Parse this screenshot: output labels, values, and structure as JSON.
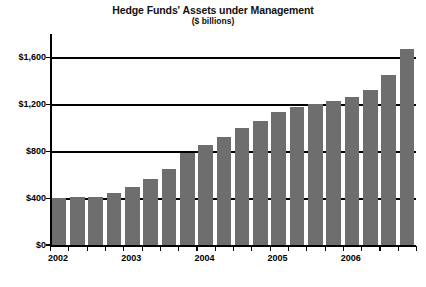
{
  "chart_data": {
    "type": "bar",
    "title": "Hedge Funds' Assets under Management",
    "subtitle": "($ billions)",
    "xlabel": "",
    "ylabel": "",
    "unit": "$ billions",
    "grid": true,
    "legend": null,
    "bar_color": "#6e6e6e",
    "axis_color": "#000000",
    "ylim": [
      0,
      1800
    ],
    "yticks": [
      0,
      400,
      800,
      1200,
      1600
    ],
    "ytick_labels": [
      "$0",
      "$400",
      "$800",
      "$1,200",
      "$1,600"
    ],
    "xtick_labels": [
      "2002",
      "2003",
      "2004",
      "2005",
      "2006"
    ],
    "categories": [
      "2002 Q1",
      "2002 Q2",
      "2002 Q3",
      "2002 Q4",
      "2003 Q1",
      "2003 Q2",
      "2003 Q3",
      "2003 Q4",
      "2004 Q1",
      "2004 Q2",
      "2004 Q3",
      "2004 Q4",
      "2005 Q1",
      "2005 Q2",
      "2005 Q3",
      "2005 Q4",
      "2006 Q1",
      "2006 Q2",
      "2006 Q3",
      "2006 Q4"
    ],
    "values": [
      410,
      415,
      420,
      450,
      500,
      570,
      660,
      790,
      860,
      930,
      1010,
      1070,
      1145,
      1190,
      1215,
      1235,
      1270,
      1330,
      1460,
      1680
    ]
  }
}
